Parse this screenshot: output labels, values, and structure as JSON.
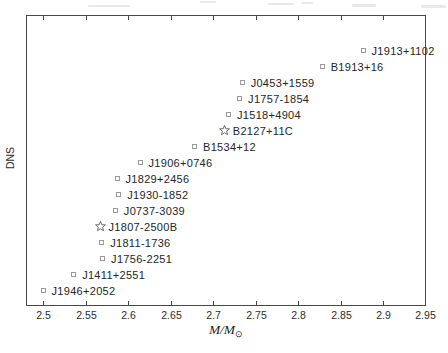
{
  "figure": {
    "ylabel": "DNS",
    "xlabel": {
      "main": "M/M",
      "sub": "⊙"
    }
  },
  "chart_data": {
    "type": "scatter",
    "title": "",
    "xlabel": "M/M_sun (total system mass)",
    "ylabel": "DNS",
    "xlim": [
      2.48,
      2.95
    ],
    "ylim": [
      0,
      18.2
    ],
    "grid": false,
    "legend": "none",
    "marker_legend": {
      "square": "open square marker",
      "star": "open star marker (globular cluster system)"
    },
    "xticks": [
      {
        "v": 2.5,
        "label": "2.5"
      },
      {
        "v": 2.55,
        "label": "2.55"
      },
      {
        "v": 2.6,
        "label": "2.6"
      },
      {
        "v": 2.65,
        "label": "2.65"
      },
      {
        "v": 2.7,
        "label": "2.7"
      },
      {
        "v": 2.75,
        "label": "2.75"
      },
      {
        "v": 2.8,
        "label": "2.8"
      },
      {
        "v": 2.85,
        "label": "2.85"
      },
      {
        "v": 2.9,
        "label": "2.9"
      },
      {
        "v": 2.95,
        "label": "2.95"
      }
    ],
    "points": [
      {
        "label": "J1946+2052",
        "x": 2.5,
        "y": 1,
        "marker": "square"
      },
      {
        "label": "J1411+2551",
        "x": 2.536,
        "y": 2,
        "marker": "square"
      },
      {
        "label": "J1756-2251",
        "x": 2.57,
        "y": 3,
        "marker": "square"
      },
      {
        "label": "J1811-1736",
        "x": 2.569,
        "y": 4,
        "marker": "square"
      },
      {
        "label": "J1807-2500B",
        "x": 2.567,
        "y": 5,
        "marker": "star"
      },
      {
        "label": "J0737-3039",
        "x": 2.585,
        "y": 6,
        "marker": "square"
      },
      {
        "label": "J1930-1852",
        "x": 2.589,
        "y": 7,
        "marker": "square"
      },
      {
        "label": "J1829+2456",
        "x": 2.587,
        "y": 8,
        "marker": "square"
      },
      {
        "label": "J1906+0746",
        "x": 2.614,
        "y": 9,
        "marker": "square"
      },
      {
        "label": "B1534+12",
        "x": 2.678,
        "y": 10,
        "marker": "square"
      },
      {
        "label": "B2127+11C",
        "x": 2.713,
        "y": 11,
        "marker": "star"
      },
      {
        "label": "J1518+4904",
        "x": 2.718,
        "y": 12,
        "marker": "square"
      },
      {
        "label": "J1757-1854",
        "x": 2.731,
        "y": 13,
        "marker": "square"
      },
      {
        "label": "J0453+1559",
        "x": 2.734,
        "y": 14,
        "marker": "square"
      },
      {
        "label": "B1913+16",
        "x": 2.828,
        "y": 15,
        "marker": "square"
      },
      {
        "label": "J1913+1102",
        "x": 2.876,
        "y": 16,
        "marker": "square"
      }
    ]
  },
  "colors": {
    "background": "#ffffff",
    "axis": "#474747",
    "square_marker": "#9a9a9a",
    "star_marker": "#6a6a6a",
    "label_text": "#262626"
  }
}
